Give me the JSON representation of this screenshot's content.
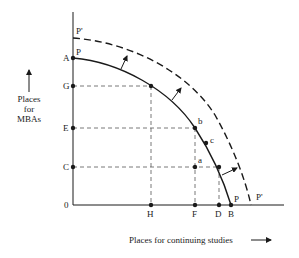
{
  "diagram": {
    "type": "production-possibility-frontier",
    "y_axis_title_lines": [
      "Places",
      "for",
      "MBAs"
    ],
    "x_axis_title": "Places for continuing studies",
    "origin_label": "0",
    "curve_labels": {
      "original_top": "P",
      "original_bottom": "P",
      "shifted_top": "P'",
      "shifted_bottom": "P'"
    },
    "y_axis_points": [
      "A",
      "G",
      "E",
      "C"
    ],
    "x_axis_points": [
      "H",
      "F",
      "D",
      "B"
    ],
    "interior_points": [
      "a",
      "b",
      "c"
    ],
    "labels": {
      "A": "A",
      "G": "G",
      "E": "E",
      "C": "C",
      "H": "H",
      "F": "F",
      "D": "D",
      "B": "B",
      "a": "a",
      "b": "b",
      "c": "c"
    },
    "colors": {
      "line": "#1a1a1a",
      "background": "#ffffff"
    }
  }
}
